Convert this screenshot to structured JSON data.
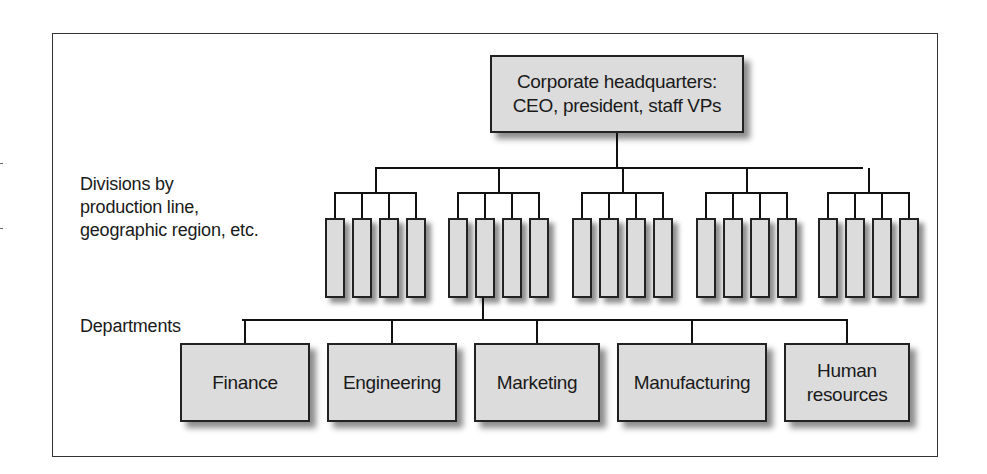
{
  "diagram": {
    "type": "organizational-chart",
    "headquarters": {
      "lines": [
        "Corporate headquarters:",
        "CEO, president, staff VPs"
      ]
    },
    "labels": {
      "divisions": [
        "Divisions by",
        "production line,",
        "geographic region, etc."
      ],
      "departments": "Departments"
    },
    "division_groups": [
      {
        "units": 4
      },
      {
        "units": 4
      },
      {
        "units": 4
      },
      {
        "units": 4
      },
      {
        "units": 4
      }
    ],
    "departments": [
      {
        "lines": [
          "Finance"
        ]
      },
      {
        "lines": [
          "Engineering"
        ]
      },
      {
        "lines": [
          "Marketing"
        ]
      },
      {
        "lines": [
          "Manufacturing"
        ]
      },
      {
        "lines": [
          "Human",
          "resources"
        ]
      }
    ],
    "colors": {
      "box_fill": "#dcdcdc",
      "line": "#111111",
      "frame": "#333333"
    }
  }
}
